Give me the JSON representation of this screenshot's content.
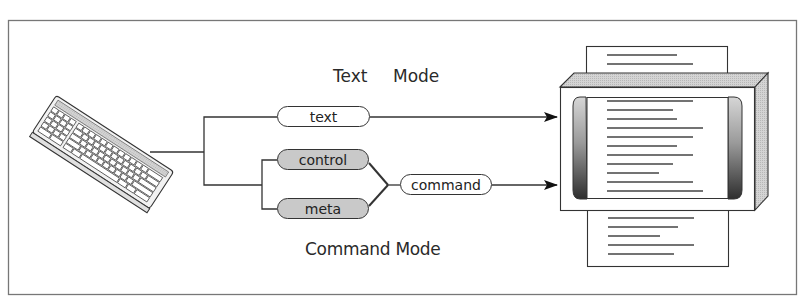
{
  "diagram": {
    "labels": {
      "text_mode_word1": "Text",
      "text_mode_word2": "Mode",
      "command_mode": "Command Mode"
    },
    "nodes": {
      "text": "text",
      "control": "control",
      "meta": "meta",
      "command": "command"
    },
    "icons": {
      "input_device": "keyboard-icon",
      "output_device": "monitor-with-scrolling-pages-icon"
    },
    "colors": {
      "line": "#333333",
      "frame": "#777777",
      "shaded_pill": "#c9c9c9"
    }
  }
}
